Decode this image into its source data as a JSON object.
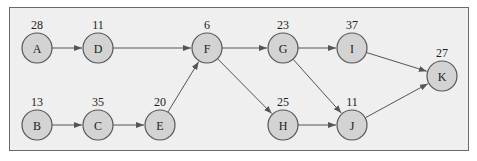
{
  "diagram": {
    "type": "directed-graph",
    "colors": {
      "background": "#efefef",
      "node_fill": "#d3d3d3",
      "stroke": "#555555",
      "border": "#6a6a6a"
    },
    "nodes": [
      {
        "id": "A",
        "label": "A",
        "weight": "28",
        "x": 37,
        "y": 48
      },
      {
        "id": "D",
        "label": "D",
        "weight": "11",
        "x": 98,
        "y": 48
      },
      {
        "id": "F",
        "label": "F",
        "weight": "6",
        "x": 207,
        "y": 48
      },
      {
        "id": "G",
        "label": "G",
        "weight": "23",
        "x": 283,
        "y": 48
      },
      {
        "id": "I",
        "label": "I",
        "weight": "37",
        "x": 352,
        "y": 48
      },
      {
        "id": "K",
        "label": "K",
        "weight": "27",
        "x": 442,
        "y": 76
      },
      {
        "id": "B",
        "label": "B",
        "weight": "13",
        "x": 37,
        "y": 125
      },
      {
        "id": "C",
        "label": "C",
        "weight": "35",
        "x": 98,
        "y": 125
      },
      {
        "id": "E",
        "label": "E",
        "weight": "20",
        "x": 160,
        "y": 125
      },
      {
        "id": "H",
        "label": "H",
        "weight": "25",
        "x": 283,
        "y": 125
      },
      {
        "id": "J",
        "label": "J",
        "weight": "11",
        "x": 352,
        "y": 125
      }
    ],
    "edges": [
      {
        "from": "A",
        "to": "D"
      },
      {
        "from": "D",
        "to": "F"
      },
      {
        "from": "B",
        "to": "C"
      },
      {
        "from": "C",
        "to": "E"
      },
      {
        "from": "E",
        "to": "F"
      },
      {
        "from": "F",
        "to": "G"
      },
      {
        "from": "F",
        "to": "H"
      },
      {
        "from": "G",
        "to": "I"
      },
      {
        "from": "G",
        "to": "J"
      },
      {
        "from": "H",
        "to": "J"
      },
      {
        "from": "I",
        "to": "K"
      },
      {
        "from": "J",
        "to": "K"
      }
    ]
  }
}
